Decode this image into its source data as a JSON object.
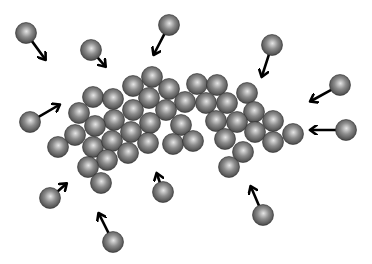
{
  "diagram": {
    "width": 372,
    "height": 264,
    "sphere_radius": 10.5,
    "colors": {
      "background": "#ffffff",
      "sphere_highlight": "#e6e6e6",
      "sphere_mid": "#8c8c8c",
      "sphere_edge": "#3e3e3e",
      "arrow": "#000000"
    },
    "cluster_spheres": [
      [
        152,
        77
      ],
      [
        133,
        86
      ],
      [
        169,
        89
      ],
      [
        197,
        84
      ],
      [
        217,
        85
      ],
      [
        247,
        93
      ],
      [
        93,
        97
      ],
      [
        113,
        99
      ],
      [
        149,
        98
      ],
      [
        185,
        102
      ],
      [
        206,
        103
      ],
      [
        227,
        103
      ],
      [
        79,
        113
      ],
      [
        133,
        110
      ],
      [
        166,
        110
      ],
      [
        254,
        112
      ],
      [
        114,
        120
      ],
      [
        95,
        126
      ],
      [
        150,
        123
      ],
      [
        181,
        125
      ],
      [
        216,
        121
      ],
      [
        237,
        122
      ],
      [
        273,
        121
      ],
      [
        75,
        135
      ],
      [
        131,
        132
      ],
      [
        255,
        132
      ],
      [
        293,
        134
      ],
      [
        58,
        147
      ],
      [
        93,
        147
      ],
      [
        112,
        141
      ],
      [
        148,
        143
      ],
      [
        173,
        144
      ],
      [
        193,
        141
      ],
      [
        225,
        139
      ],
      [
        273,
        142
      ],
      [
        128,
        153
      ],
      [
        243,
        152
      ],
      [
        107,
        160
      ],
      [
        88,
        167
      ],
      [
        229,
        167
      ],
      [
        101,
        183
      ]
    ],
    "free_particles": [
      {
        "id": "p1",
        "center": [
          26,
          33
        ],
        "arrow_to": [
          45,
          59
        ]
      },
      {
        "id": "p2",
        "center": [
          91,
          50
        ],
        "arrow_to": [
          105,
          66
        ]
      },
      {
        "id": "p3",
        "center": [
          169,
          25
        ],
        "arrow_to": [
          154,
          54
        ]
      },
      {
        "id": "p4",
        "center": [
          272,
          45
        ],
        "arrow_to": [
          262,
          76
        ]
      },
      {
        "id": "p5",
        "center": [
          340,
          85
        ],
        "arrow_to": [
          311,
          101
        ]
      },
      {
        "id": "p6",
        "center": [
          346,
          130
        ],
        "arrow_to": [
          311,
          130
        ]
      },
      {
        "id": "p7",
        "center": [
          30,
          122
        ],
        "arrow_to": [
          59,
          105
        ]
      },
      {
        "id": "p8",
        "center": [
          50,
          198
        ],
        "arrow_to": [
          66,
          184
        ]
      },
      {
        "id": "p9",
        "center": [
          113,
          242
        ],
        "arrow_to": [
          99,
          214
        ]
      },
      {
        "id": "p10",
        "center": [
          163,
          192
        ],
        "arrow_to": [
          157,
          174
        ]
      },
      {
        "id": "p11",
        "center": [
          263,
          215
        ],
        "arrow_to": [
          251,
          187
        ]
      }
    ]
  }
}
